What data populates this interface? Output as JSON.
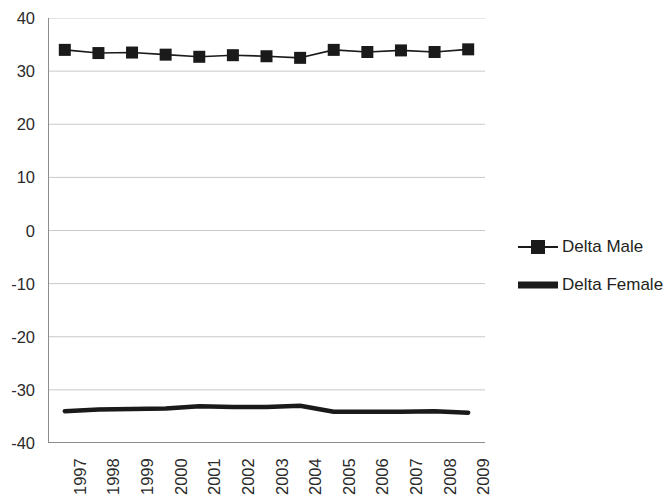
{
  "chart_data": {
    "type": "line",
    "title": "",
    "xlabel": "",
    "ylabel": "",
    "categories": [
      "1997",
      "1998",
      "1999",
      "2000",
      "2001",
      "2002",
      "2003",
      "2004",
      "2005",
      "2006",
      "2007",
      "2008",
      "2009"
    ],
    "ylim": [
      -40,
      40
    ],
    "ytick_labels": [
      "40",
      "30",
      "20",
      "10",
      "0",
      "-10",
      "-20",
      "-30",
      "-40"
    ],
    "ytick_values": [
      40,
      30,
      20,
      10,
      0,
      -10,
      -20,
      -30,
      -40
    ],
    "grid": true,
    "grid_axis": "y",
    "legend_position": "right",
    "series": [
      {
        "name": "Delta Male",
        "marker": "square",
        "color": "#1a1a1a",
        "values": [
          34.0,
          33.4,
          33.5,
          33.1,
          32.7,
          33.0,
          32.8,
          32.5,
          34.0,
          33.6,
          33.9,
          33.6,
          34.1
        ]
      },
      {
        "name": "Delta Female",
        "marker": "none",
        "color": "#1a1a1a",
        "values": [
          -34.0,
          -33.7,
          -33.6,
          -33.5,
          -33.1,
          -33.2,
          -33.2,
          -33.0,
          -34.1,
          -34.1,
          -34.1,
          -34.0,
          -34.3
        ]
      }
    ]
  },
  "legend": {
    "items": [
      {
        "label": "Delta Male",
        "key": "line-with-square-marker"
      },
      {
        "label": "Delta Female",
        "key": "thick-line"
      }
    ]
  }
}
